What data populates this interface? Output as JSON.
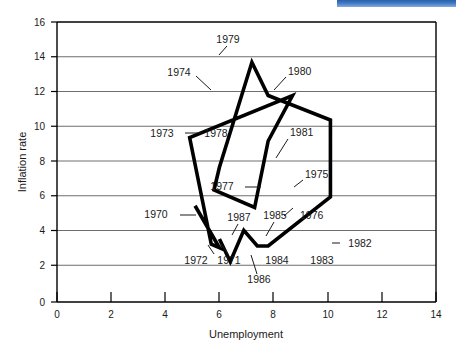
{
  "chart_data": {
    "type": "line",
    "title": "",
    "xlabel": "Unemployment",
    "ylabel": "Inflation rate",
    "xlim": [
      0,
      14
    ],
    "ylim": [
      0,
      16
    ],
    "xticks": [
      0,
      2,
      4,
      6,
      8,
      10,
      12,
      14
    ],
    "yticks": [
      0,
      2,
      4,
      6,
      8,
      10,
      12,
      14,
      16
    ],
    "grid": "horizontal",
    "legend": "none",
    "series": [
      {
        "name": "Phillips curve path 1970-1987",
        "x": [
          5.1,
          6.0,
          5.7,
          4.9,
          8.7,
          7.8,
          7.3,
          5.8,
          6.0,
          7.2,
          7.8,
          10.1,
          10.1,
          7.8,
          7.4,
          6.9,
          6.4,
          6.0
        ],
        "y": [
          5.5,
          3.1,
          3.3,
          9.4,
          11.8,
          9.2,
          5.4,
          6.4,
          7.7,
          13.7,
          11.8,
          10.4,
          6.0,
          3.2,
          3.2,
          4.1,
          2.3,
          3.6
        ],
        "labels": [
          "1970",
          "1972",
          "1971",
          "1973",
          "1974",
          "1978",
          "1977",
          "1976",
          "1975",
          "1979",
          "1980",
          "1981",
          "1982",
          "1983",
          "1984",
          "1985",
          "1986",
          "1987"
        ]
      }
    ],
    "points": [
      {
        "label": "1970",
        "x": 5.1,
        "y": 5.5
      },
      {
        "label": "1971",
        "x": 5.9,
        "y": 3.35
      },
      {
        "label": "1972",
        "x": 5.75,
        "y": 3.1
      },
      {
        "label": "1973",
        "x": 4.9,
        "y": 9.4
      },
      {
        "label": "1974",
        "x": 5.7,
        "y": 11.8
      },
      {
        "label": "1975",
        "x": 8.7,
        "y": 6.5
      },
      {
        "label": "1976",
        "x": 8.1,
        "y": 5.4
      },
      {
        "label": "1977",
        "x": 7.3,
        "y": 4.9
      },
      {
        "label": "1978",
        "x": 5.75,
        "y": 9.6
      },
      {
        "label": "1979",
        "x": 6.0,
        "y": 13.7
      },
      {
        "label": "1980",
        "x": 7.25,
        "y": 11.8
      },
      {
        "label": "1981",
        "x": 7.8,
        "y": 6.7
      },
      {
        "label": "1982",
        "x": 10.1,
        "y": 3.25
      },
      {
        "label": "1983",
        "x": 10.0,
        "y": 3.2
      },
      {
        "label": "1984",
        "x": 7.9,
        "y": 3.25
      },
      {
        "label": "1985",
        "x": 6.5,
        "y": 3.6
      },
      {
        "label": "1986",
        "x": 6.3,
        "y": 2.4
      },
      {
        "label": "1987",
        "x": 5.9,
        "y": 3.6
      }
    ]
  },
  "axes": {
    "x_title": "Unemployment",
    "y_title": "Inflation rate",
    "x_ticks": [
      "0",
      "2",
      "4",
      "6",
      "8",
      "10",
      "12",
      "14"
    ],
    "y_ticks": [
      "0",
      "2",
      "4",
      "6",
      "8",
      "10",
      "12",
      "14",
      "16"
    ]
  },
  "annotations": [
    {
      "name": "label-1979",
      "text": "1979"
    },
    {
      "name": "label-1974",
      "text": "1974"
    },
    {
      "name": "label-1980",
      "text": "1980"
    },
    {
      "name": "label-1973",
      "text": "1973"
    },
    {
      "name": "label-1978",
      "text": "1978"
    },
    {
      "name": "label-1981",
      "text": "1981"
    },
    {
      "name": "label-1975",
      "text": "1975"
    },
    {
      "name": "label-1977",
      "text": "1977"
    },
    {
      "name": "label-1970",
      "text": "1970"
    },
    {
      "name": "label-1987",
      "text": "1987"
    },
    {
      "name": "label-1985",
      "text": "1985"
    },
    {
      "name": "label-1976",
      "text": "1976"
    },
    {
      "name": "label-1972",
      "text": "1972"
    },
    {
      "name": "label-1971",
      "text": "1971"
    },
    {
      "name": "label-1984",
      "text": "1984"
    },
    {
      "name": "label-1983",
      "text": "1983"
    },
    {
      "name": "label-1982",
      "text": "1982"
    },
    {
      "name": "label-1986",
      "text": "1986"
    }
  ],
  "colors": {
    "line": "#000000",
    "grid": "#6e6e6e",
    "axis": "#000000",
    "background": "#ffffff",
    "artifact": "#2f67b0"
  }
}
